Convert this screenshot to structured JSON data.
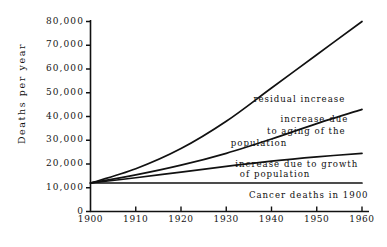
{
  "chart_data": {
    "type": "line",
    "title": "",
    "xlabel": "",
    "ylabel": "Deaths per year",
    "xlim": [
      1900,
      1960
    ],
    "ylim": [
      0,
      80000
    ],
    "grid": false,
    "legend_position": "inline-annotations",
    "xticks": [
      "1900",
      "1910",
      "1920",
      "1930",
      "1940",
      "1950",
      "1960"
    ],
    "yticks": [
      "0",
      "10,000",
      "20,000",
      "30,000",
      "40,000",
      "50,000",
      "60,000",
      "70,000",
      "80,000"
    ],
    "x": [
      1900,
      1910,
      1920,
      1930,
      1940,
      1950,
      1960
    ],
    "series": [
      {
        "name": "Cancer deaths in 1900",
        "values": [
          12000,
          12000,
          12000,
          12000,
          12000,
          12000,
          12000
        ]
      },
      {
        "name": "increase due to growth of population",
        "values": [
          12000,
          14200,
          16600,
          19000,
          21200,
          23000,
          24500
        ]
      },
      {
        "name": "increase due to aging of the population",
        "values": [
          12000,
          15400,
          19500,
          24500,
          30500,
          37000,
          43000
        ]
      },
      {
        "name": "residual increase",
        "values": [
          12000,
          18000,
          26500,
          38000,
          52000,
          66000,
          80000
        ]
      }
    ],
    "annotations": [
      {
        "text": "residual increase",
        "x": 1936,
        "y": 47000
      },
      {
        "text": "increase due",
        "x": 1942,
        "y": 38500
      },
      {
        "text": "to aging of the",
        "x": 1939,
        "y": 33500
      },
      {
        "text": "population",
        "x": 1931,
        "y": 28500
      },
      {
        "text": "increase due to growth",
        "x": 1932,
        "y": 19500
      },
      {
        "text": "of population",
        "x": 1933,
        "y": 15500
      },
      {
        "text": "Cancer deaths in 1900",
        "x": 1935,
        "y": 6500
      }
    ]
  },
  "axis": {
    "y_title": "Deaths per year"
  },
  "colors": {
    "ink": "#111111",
    "background": "#ffffff"
  }
}
